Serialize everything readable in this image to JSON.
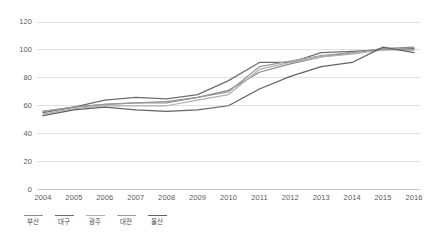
{
  "chart_data": {
    "type": "line",
    "title": "",
    "xlabel": "",
    "ylabel": "",
    "x": [
      2004,
      2005,
      2006,
      2007,
      2008,
      2009,
      2010,
      2011,
      2012,
      2013,
      2014,
      2015,
      2016
    ],
    "xtick_labels": [
      "2004",
      "2005",
      "2006",
      "2007",
      "2008",
      "2009",
      "2010",
      "2011",
      "2012",
      "2013",
      "2014",
      "2015",
      "2016"
    ],
    "ytick_labels": [
      "0",
      "20",
      "40",
      "60",
      "80",
      "100",
      "120"
    ],
    "yticks": [
      0,
      20,
      40,
      60,
      80,
      100,
      120
    ],
    "ylim": [
      0,
      120
    ],
    "xlim": [
      2004,
      2016
    ],
    "grid": "horizontal",
    "legend_position": "bottom-left",
    "series": [
      {
        "name": "부산",
        "color": "#8a8a8a",
        "values": [
          56,
          59,
          61,
          62,
          63,
          66,
          71,
          84,
          90,
          95,
          98,
          101,
          102
        ]
      },
      {
        "name": "대구",
        "color": "#6e6e6e",
        "values": [
          55,
          59,
          64,
          66,
          65,
          68,
          78,
          91,
          91,
          98,
          99,
          100,
          101
        ]
      },
      {
        "name": "광주",
        "color": "#b0b0b0",
        "values": [
          54,
          58,
          60,
          60,
          60,
          64,
          68,
          86,
          91,
          95,
          97,
          100,
          100
        ]
      },
      {
        "name": "대전",
        "color": "#9a9a9a",
        "values": [
          56,
          59,
          61,
          62,
          62,
          66,
          70,
          88,
          92,
          96,
          98,
          101,
          100
        ]
      },
      {
        "name": "울산",
        "color": "#636363",
        "values": [
          53,
          57,
          59,
          57,
          56,
          57,
          60,
          72,
          81,
          88,
          91,
          102,
          98
        ]
      }
    ]
  },
  "axis": {
    "tick_color": "#5a5a5a",
    "grid_color": "#e0e0e0",
    "baseline_color": "#c8c8c8"
  }
}
